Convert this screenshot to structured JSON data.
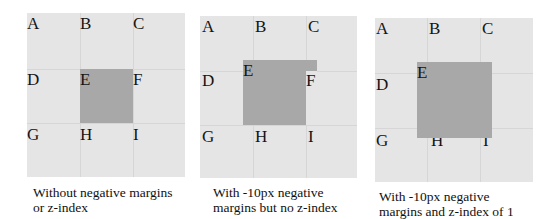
{
  "figure": {
    "panels": [
      {
        "id": "no-negative-margins",
        "cells": [
          "A",
          "B",
          "C",
          "D",
          "E",
          "F",
          "G",
          "H",
          "I"
        ],
        "caption_lines": [
          "Without negative margins",
          "or z-index"
        ]
      },
      {
        "id": "negative-margins-no-z-index",
        "cells": [
          "A",
          "B",
          "C",
          "D",
          "E",
          "F",
          "G",
          "H",
          "I"
        ],
        "caption_lines": [
          "With -10px negative",
          "margins but no z-index"
        ]
      },
      {
        "id": "negative-margins-z-index-1",
        "cells": [
          "A",
          "B",
          "C",
          "D",
          "E",
          "F",
          "G",
          "H",
          "I"
        ],
        "caption_lines": [
          "With -10px negative",
          "margins and z-index of 1"
        ]
      }
    ],
    "colors": {
      "panel_background": "#e5e5e5",
      "grid_line": "#d6d6d6",
      "highlight_box": "#a8a8a8",
      "text": "#111111"
    }
  }
}
